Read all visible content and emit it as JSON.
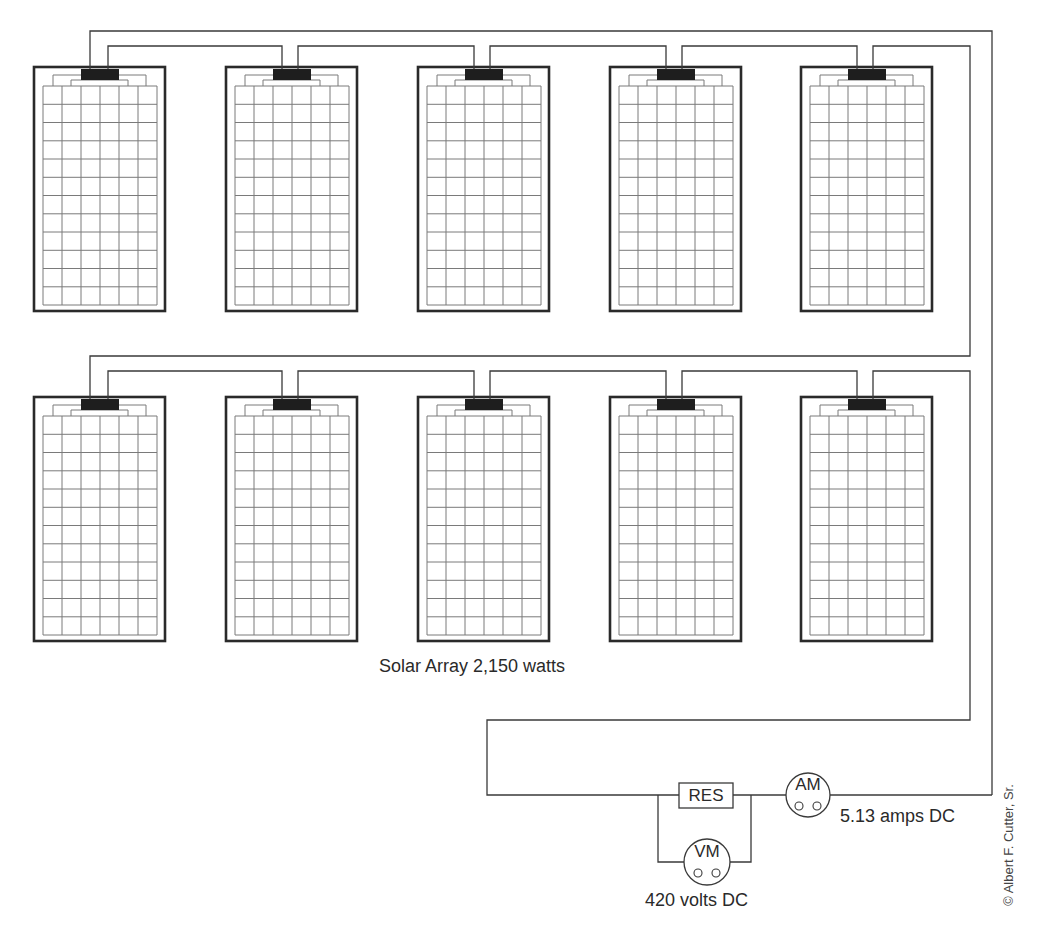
{
  "title": "Solar Array 2,150 watts",
  "array": {
    "label": "Solar Array 2,150 watts",
    "rows": 2,
    "panels_per_row": 5,
    "panel_grid": {
      "columns": 6,
      "rows": 12
    },
    "panel_x": [
      34,
      226,
      418,
      610,
      801
    ],
    "row_y": [
      67,
      397
    ],
    "panel_width": 131,
    "panel_height": 244
  },
  "circuit": {
    "resistor": {
      "label": "RES"
    },
    "ammeter": {
      "label": "AM",
      "reading": "5.13 amps DC"
    },
    "voltmeter": {
      "label": "VM",
      "reading": "420 volts DC"
    }
  },
  "credit": "© Albert F. Cutter, Sr.",
  "colors": {
    "line": "#3a3a3a",
    "frame": "#2a2a2a",
    "grid": "#7a7a7a",
    "junction": "#1e1e1e",
    "background": "#ffffff"
  }
}
